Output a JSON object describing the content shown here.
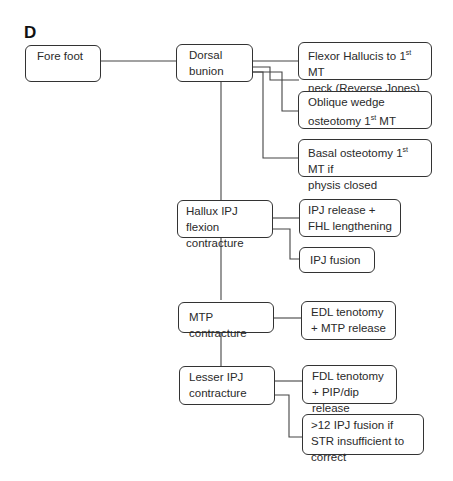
{
  "panel_label": "D",
  "nodes": {
    "fore_foot": "Fore foot",
    "dorsal_bunion": "Dorsal bunion",
    "flexor_hallucis": "Flexor Hallucis to 1st MT neck (Reverse Jones)",
    "oblique_wedge": "Oblique wedge osteotomy 1st MT",
    "basal_osteotomy": "Basal osteotomy 1st MT if physis closed",
    "hallux_ipj": "Hallux IPJ flexion contracture",
    "ipj_release_fhl": "IPJ release + FHL lengthening",
    "ipj_fusion": "IPJ fusion",
    "mtp_contracture": "MTP contracture",
    "edl_tenotomy": "EDL tenotomy + MTP release",
    "lesser_ipj": "Lesser IPJ contracture",
    "fdl_tenotomy": "FDL tenotomy + PIP/dip release",
    "ipj_fusion_str": ">12 IPJ fusion if STR insufficient to correct"
  },
  "superscripts": {
    "st": "st"
  },
  "split_text": {
    "flexor_a": "Flexor Hallucis to 1",
    "flexor_b": " MT",
    "flexor_c": "neck (Reverse Jones)",
    "oblique_a": "Oblique wedge",
    "oblique_b": "osteotomy 1",
    "oblique_c": " MT",
    "basal_a": "Basal osteotomy 1",
    "basal_b": " MT if",
    "basal_c": "physis closed"
  }
}
